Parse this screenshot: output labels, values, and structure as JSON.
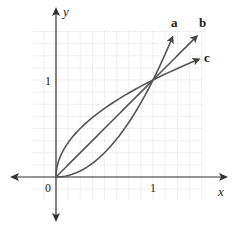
{
  "chart_data": {
    "type": "line",
    "title": "",
    "xlabel": "x",
    "ylabel": "y",
    "xlim": [
      -0.4,
      1.5
    ],
    "ylim": [
      -0.45,
      1.5
    ],
    "grid": true,
    "grid_step": 0.125,
    "x_ticks": [
      {
        "value": 0,
        "label": "0"
      },
      {
        "value": 1,
        "label": "1"
      }
    ],
    "y_ticks": [
      {
        "value": 1,
        "label": "1"
      }
    ],
    "origin_label": "0",
    "series": [
      {
        "name": "a",
        "label": "a",
        "formula": "y = x^2",
        "x": [
          0,
          0.25,
          0.5,
          0.75,
          1,
          1.2
        ],
        "y": [
          0,
          0.0625,
          0.25,
          0.5625,
          1,
          1.44
        ]
      },
      {
        "name": "b",
        "label": "b",
        "formula": "y = x",
        "x": [
          0,
          0.5,
          1,
          1.45
        ],
        "y": [
          0,
          0.5,
          1,
          1.45
        ]
      },
      {
        "name": "c",
        "label": "c",
        "formula": "y = sqrt(x)",
        "x": [
          0,
          0.0625,
          0.25,
          0.5,
          1,
          1.5
        ],
        "y": [
          0,
          0.25,
          0.5,
          0.707,
          1,
          1.225
        ]
      }
    ],
    "intersection_points": [
      [
        0,
        0
      ],
      [
        1,
        1
      ]
    ],
    "colors": {
      "curve": "#555555",
      "axis": "#333333",
      "grid": "#d8d8d8"
    }
  },
  "labels": {
    "x_axis": "x",
    "y_axis": "y",
    "origin": "0",
    "x_one": "1",
    "y_one": "1",
    "curve_a": "a",
    "curve_b": "b",
    "curve_c": "c"
  }
}
